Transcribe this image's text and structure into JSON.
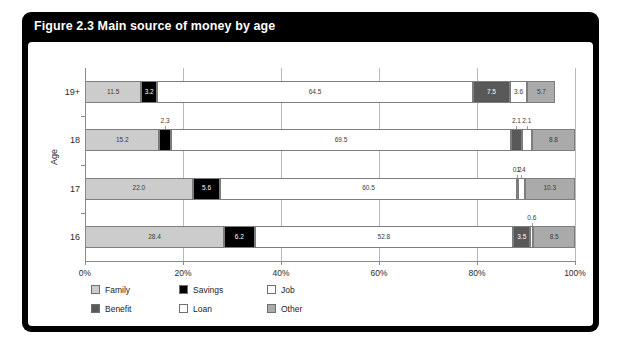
{
  "figure": {
    "title": "Figure 2.3 Main source of money by age"
  },
  "legend": {
    "items": [
      {
        "label": "Family",
        "color": "#cccccc"
      },
      {
        "label": "Savings",
        "color": "#000000"
      },
      {
        "label": "Job",
        "color": "#ffffff"
      },
      {
        "label": "Benefit",
        "color": "#595959"
      },
      {
        "label": "Loan",
        "color": "#ffffff"
      },
      {
        "label": "Other",
        "color": "#aaaaaa"
      }
    ]
  },
  "chart_data": {
    "type": "bar",
    "orientation": "horizontal",
    "stacked": true,
    "stack_mode": "percent",
    "title": "Figure 2.3 Main source of money by age",
    "xlabel": "",
    "ylabel": "Age",
    "xlim": [
      0,
      100
    ],
    "xticks": [
      0,
      20,
      40,
      60,
      80,
      100
    ],
    "xtick_labels": [
      "0%",
      "20%",
      "40%",
      "60%",
      "80%",
      "100%"
    ],
    "grid": true,
    "legend_position": "bottom-left",
    "categories": [
      "19+",
      "18",
      "17",
      "16"
    ],
    "series": [
      {
        "name": "Family",
        "color": "#cccccc",
        "values": [
          11.5,
          15.2,
          22.0,
          28.4
        ]
      },
      {
        "name": "Savings",
        "color": "#000000",
        "values": [
          3.2,
          2.3,
          5.6,
          6.2
        ]
      },
      {
        "name": "Job",
        "color": "#ffffff",
        "values": [
          64.5,
          69.5,
          60.5,
          52.8
        ]
      },
      {
        "name": "Benefit",
        "color": "#595959",
        "values": [
          7.5,
          2.1,
          0.2,
          3.5
        ]
      },
      {
        "name": "Loan",
        "color": "#ffffff",
        "values": [
          3.6,
          2.1,
          1.4,
          0.6
        ]
      },
      {
        "name": "Other",
        "color": "#aaaaaa",
        "values": [
          5.7,
          8.8,
          10.3,
          8.5
        ]
      }
    ]
  }
}
